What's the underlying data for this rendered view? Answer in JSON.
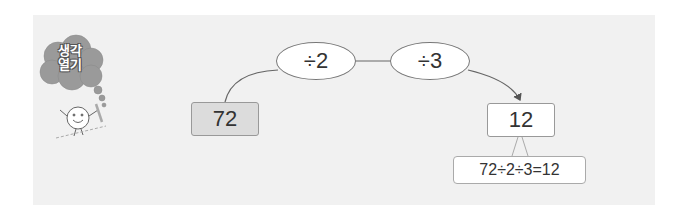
{
  "header": {
    "badge_line1": "생각",
    "badge_line2": "열기"
  },
  "diagram": {
    "start_value": "72",
    "steps": [
      {
        "label": "÷2"
      },
      {
        "label": "÷3"
      }
    ],
    "result_value": "12",
    "expression": "72÷2÷3=12"
  },
  "colors": {
    "panel_bg": "#f1f1f1",
    "start_box_bg": "#dcdcdc",
    "cloud": "#9a9a9a"
  }
}
